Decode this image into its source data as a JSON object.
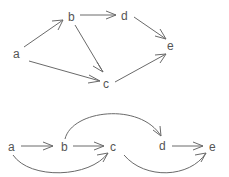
{
  "diagram": {
    "type": "directed-graph",
    "edge_color": "#6a6a6a",
    "label_color": "#555555",
    "graphs": [
      {
        "name": "top-graph",
        "nodes": [
          {
            "id": "a",
            "label": "a",
            "x": 17,
            "y": 58
          },
          {
            "id": "b",
            "label": "b",
            "x": 72,
            "y": 21
          },
          {
            "id": "c",
            "label": "c",
            "x": 107,
            "y": 87
          },
          {
            "id": "d",
            "label": "d",
            "x": 125,
            "y": 20
          },
          {
            "id": "e",
            "label": "e",
            "x": 171,
            "y": 50
          }
        ],
        "edges": [
          {
            "from": "a",
            "to": "b"
          },
          {
            "from": "a",
            "to": "c"
          },
          {
            "from": "b",
            "to": "d"
          },
          {
            "from": "b",
            "to": "c"
          },
          {
            "from": "d",
            "to": "e"
          },
          {
            "from": "c",
            "to": "e"
          }
        ]
      },
      {
        "name": "bottom-graph",
        "nodes": [
          {
            "id": "a",
            "label": "a",
            "x": 12,
            "y": 151
          },
          {
            "id": "b",
            "label": "b",
            "x": 65,
            "y": 150
          },
          {
            "id": "c",
            "label": "c",
            "x": 114,
            "y": 150
          },
          {
            "id": "d",
            "label": "d",
            "x": 163,
            "y": 149
          },
          {
            "id": "e",
            "label": "e",
            "x": 213,
            "y": 151
          }
        ],
        "edges": [
          {
            "from": "a",
            "to": "b",
            "style": "straight"
          },
          {
            "from": "b",
            "to": "c",
            "style": "straight"
          },
          {
            "from": "d",
            "to": "e",
            "style": "straight"
          },
          {
            "from": "b",
            "to": "d",
            "style": "arc-over"
          },
          {
            "from": "a",
            "to": "c",
            "style": "arc-under"
          },
          {
            "from": "c",
            "to": "e",
            "style": "arc-under"
          }
        ]
      }
    ]
  }
}
